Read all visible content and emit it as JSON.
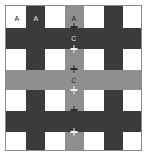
{
  "figure": {
    "width": 147,
    "height": 156,
    "background": "#ffffff",
    "frame": {
      "x": 5,
      "y": 5,
      "width": 137,
      "height": 146,
      "border_color": "#8a8a8a",
      "fill": "#ffffff"
    },
    "palette": {
      "white": "#ffffff",
      "dark_gray": "#3b3b3b",
      "mid_gray": "#8f8f8f",
      "label_on_dark": "#e8e8e8",
      "label_on_light": "#1a1a1a",
      "marker_white": "#f2f2f2",
      "marker_black": "#2a2a2a"
    },
    "columns": [
      {
        "index": 0,
        "x": 0,
        "width": 20,
        "tone": "light"
      },
      {
        "index": 1,
        "x": 20,
        "width": 19,
        "tone": "dark"
      },
      {
        "index": 2,
        "x": 39,
        "width": 20,
        "tone": "light"
      },
      {
        "index": 3,
        "x": 59,
        "width": 19,
        "tone": "mid"
      },
      {
        "index": 4,
        "x": 78,
        "width": 20,
        "tone": "light"
      },
      {
        "index": 5,
        "x": 98,
        "width": 19,
        "tone": "dark"
      },
      {
        "index": 6,
        "x": 117,
        "width": 18,
        "tone": "light"
      }
    ],
    "rows": [
      {
        "index": 0,
        "y": 0,
        "height": 22,
        "tone": "light"
      },
      {
        "index": 1,
        "y": 22,
        "height": 21,
        "tone": "dark"
      },
      {
        "index": 2,
        "y": 43,
        "height": 21,
        "tone": "light"
      },
      {
        "index": 3,
        "y": 64,
        "height": 20,
        "tone": "mid"
      },
      {
        "index": 4,
        "y": 84,
        "height": 21,
        "tone": "light"
      },
      {
        "index": 5,
        "y": 105,
        "height": 21,
        "tone": "dark"
      },
      {
        "index": 6,
        "y": 126,
        "height": 18,
        "tone": "light"
      }
    ],
    "labels": [
      {
        "id": "label-a-1",
        "text": "A",
        "x": 11,
        "y": 12,
        "on": "light"
      },
      {
        "id": "label-a-2",
        "text": "A",
        "x": 30,
        "y": 12,
        "on": "dark"
      },
      {
        "id": "label-a-3",
        "text": "A",
        "x": 68,
        "y": 12,
        "on": "mid"
      },
      {
        "id": "label-c-1",
        "text": "C",
        "x": 68,
        "y": 32,
        "on": "dark"
      },
      {
        "id": "label-c-2",
        "text": "C",
        "x": 68,
        "y": 74,
        "on": "mid"
      }
    ],
    "markers": [
      {
        "id": "marker-0",
        "x": 68,
        "y": 21,
        "tone": "black"
      },
      {
        "id": "marker-1",
        "x": 68,
        "y": 43,
        "tone": "white"
      },
      {
        "id": "marker-2",
        "x": 68,
        "y": 63,
        "tone": "black"
      },
      {
        "id": "marker-3",
        "x": 68,
        "y": 84,
        "tone": "white"
      },
      {
        "id": "marker-4",
        "x": 68,
        "y": 104,
        "tone": "black"
      },
      {
        "id": "marker-5",
        "x": 68,
        "y": 126,
        "tone": "white"
      }
    ],
    "marker_stems": [
      {
        "id": "stem-0",
        "x": 68,
        "y": 17,
        "height": 8,
        "tone": "black"
      },
      {
        "id": "stem-1",
        "x": 68,
        "y": 39,
        "height": 8,
        "tone": "white"
      },
      {
        "id": "stem-2",
        "x": 68,
        "y": 59,
        "height": 8,
        "tone": "black"
      },
      {
        "id": "stem-3",
        "x": 68,
        "y": 80,
        "height": 8,
        "tone": "white"
      },
      {
        "id": "stem-4",
        "x": 68,
        "y": 100,
        "height": 8,
        "tone": "black"
      },
      {
        "id": "stem-5",
        "x": 68,
        "y": 122,
        "height": 8,
        "tone": "white"
      }
    ]
  }
}
